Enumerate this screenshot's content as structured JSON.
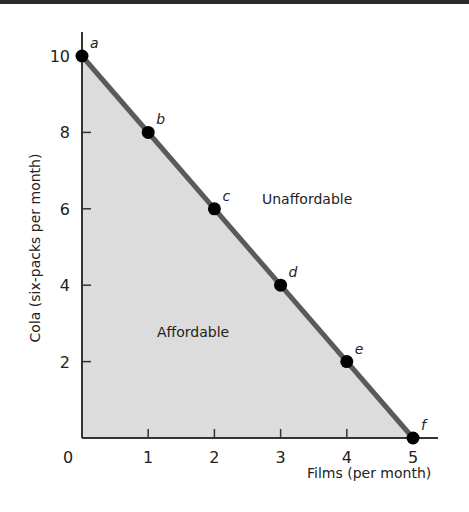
{
  "chart_data": {
    "type": "line",
    "title": "",
    "xlabel": "Films (per month)",
    "ylabel": "Cola (six-packs per month)",
    "xlim": [
      0,
      5.4
    ],
    "ylim": [
      0,
      10.8
    ],
    "x_ticks": [
      "0",
      "1",
      "2",
      "3",
      "4",
      "5"
    ],
    "y_ticks": [
      "2",
      "4",
      "6",
      "8",
      "10"
    ],
    "grid": false,
    "series": [
      {
        "name": "Budget line",
        "x": [
          0,
          1,
          2,
          3,
          4,
          5
        ],
        "y": [
          10,
          8,
          6,
          4,
          2,
          0
        ],
        "point_labels": [
          "a",
          "b",
          "c",
          "d",
          "e",
          "f"
        ]
      }
    ],
    "annotations": [
      {
        "text": "Affordable",
        "region": "below budget line (shaded)"
      },
      {
        "text": "Unaffordable",
        "region": "above budget line"
      }
    ],
    "colors": {
      "line": "#5a5a5a",
      "fill": "#dcdcdc",
      "points": "#000000",
      "axes": "#333333"
    }
  },
  "labels": {
    "affordable": "Affordable",
    "unaffordable": "Unaffordable",
    "x_axis_title": "Films (per month)",
    "y_axis_title": "Cola (six-packs per month)",
    "origin": "0"
  }
}
